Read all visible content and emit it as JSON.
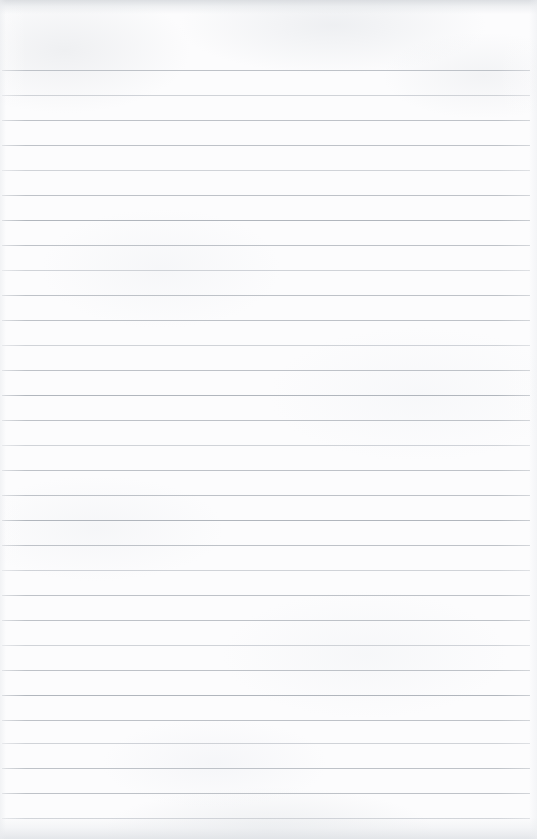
{
  "document": {
    "kind": "scanned-ruled-paper",
    "title": "Blank Ruled Notebook Page",
    "page_width": 537,
    "page_height": 839,
    "content_text": "",
    "has_handwriting": false,
    "has_printed_text": false,
    "has_margin_rule": false,
    "has_punch_holes": false,
    "colors": {
      "paper": "#fcfcfd",
      "rule": "#b9bdc3",
      "rule_light": "#c4c8ce",
      "rule_dark": "#aeb3ba",
      "edge_shadow": "#d6d9dd"
    },
    "ruling": {
      "orientation": "horizontal",
      "line_count": 31,
      "spacing_px": 25,
      "first_line_y": 70,
      "last_line_y": 818,
      "line_start_x": 2,
      "line_end_x": 530,
      "line_thickness_px": 1,
      "lines": [
        {
          "y": 70,
          "weight": "normal"
        },
        {
          "y": 95,
          "weight": "soft"
        },
        {
          "y": 120,
          "weight": "normal"
        },
        {
          "y": 145,
          "weight": "normal"
        },
        {
          "y": 170,
          "weight": "soft"
        },
        {
          "y": 195,
          "weight": "normal"
        },
        {
          "y": 220,
          "weight": "dark"
        },
        {
          "y": 245,
          "weight": "normal"
        },
        {
          "y": 270,
          "weight": "soft"
        },
        {
          "y": 295,
          "weight": "normal"
        },
        {
          "y": 320,
          "weight": "normal"
        },
        {
          "y": 345,
          "weight": "soft"
        },
        {
          "y": 370,
          "weight": "normal"
        },
        {
          "y": 395,
          "weight": "dark"
        },
        {
          "y": 420,
          "weight": "normal"
        },
        {
          "y": 445,
          "weight": "soft"
        },
        {
          "y": 470,
          "weight": "normal"
        },
        {
          "y": 495,
          "weight": "normal"
        },
        {
          "y": 520,
          "weight": "dark"
        },
        {
          "y": 545,
          "weight": "normal"
        },
        {
          "y": 570,
          "weight": "soft"
        },
        {
          "y": 595,
          "weight": "normal"
        },
        {
          "y": 620,
          "weight": "normal"
        },
        {
          "y": 645,
          "weight": "soft"
        },
        {
          "y": 670,
          "weight": "normal"
        },
        {
          "y": 695,
          "weight": "dark"
        },
        {
          "y": 720,
          "weight": "normal"
        },
        {
          "y": 743,
          "weight": "soft"
        },
        {
          "y": 768,
          "weight": "normal"
        },
        {
          "y": 793,
          "weight": "normal"
        },
        {
          "y": 818,
          "weight": "soft"
        }
      ]
    }
  }
}
